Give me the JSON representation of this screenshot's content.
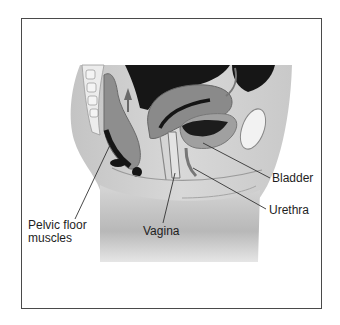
{
  "figure": {
    "labels": [
      {
        "id": "bladder",
        "text": "Bladder",
        "x": 272,
        "y": 172,
        "line": {
          "x1": 203,
          "y1": 143,
          "x2": 270,
          "y2": 178
        }
      },
      {
        "id": "urethra",
        "text": "Urethra",
        "x": 269,
        "y": 204,
        "line": {
          "x1": 193,
          "y1": 168,
          "x2": 266,
          "y2": 209
        }
      },
      {
        "id": "vagina",
        "text": "Vagina",
        "x": 143,
        "y": 225,
        "line": {
          "x1": 175,
          "y1": 173,
          "x2": 163,
          "y2": 223
        }
      },
      {
        "id": "pelvic-floor-muscles",
        "line1": "Pelvic floor",
        "line2": "muscles",
        "x": 28,
        "y": 219,
        "line": {
          "x1": 110,
          "y1": 145,
          "x2": 75,
          "y2": 219
        }
      }
    ],
    "colors": {
      "frame": "#4a4a4a",
      "body_light": "#d9d9d9",
      "body_mid": "#bdbdbd",
      "organ_dark": "#1a1a1a",
      "organ_mid": "#8c8c8c",
      "bladder": "#9a9a9a",
      "leader": "#333333"
    }
  }
}
